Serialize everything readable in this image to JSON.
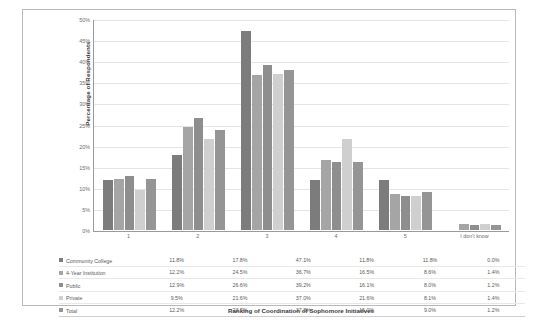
{
  "chart_data": {
    "type": "bar",
    "title": "",
    "xlabel": "Ranking of Coordination of Sophomore Initiatives",
    "ylabel": "Percentage of Respondents",
    "categories": [
      "1",
      "2",
      "3",
      "4",
      "5",
      "I don't know"
    ],
    "ylim": [
      0,
      50
    ],
    "ytick_labels": [
      "50%",
      "45%",
      "40%",
      "35%",
      "30%",
      "25%",
      "20%",
      "15%",
      "10%",
      "5%",
      "0%"
    ],
    "ytick_values": [
      50,
      45,
      40,
      35,
      30,
      25,
      20,
      15,
      10,
      5,
      0
    ],
    "grid": true,
    "legend_position": "table-below",
    "series": [
      {
        "name": "Community College",
        "color": "#7c7c7c",
        "values": [
          11.8,
          17.8,
          47.1,
          11.8,
          11.8,
          0.0
        ],
        "labels": [
          "11.8%",
          "17.8%",
          "47.1%",
          "11.8%",
          "11.8%",
          "0.0%"
        ]
      },
      {
        "name": "4-Year Institution",
        "color": "#a5a5a5",
        "values": [
          12.2,
          24.5,
          36.7,
          16.5,
          8.6,
          1.4
        ],
        "labels": [
          "12.2%",
          "24.5%",
          "36.7%",
          "16.5%",
          "8.6%",
          "1.4%"
        ]
      },
      {
        "name": "Public",
        "color": "#8e8e8e",
        "values": [
          12.9,
          26.6,
          39.2,
          16.1,
          8.0,
          1.2
        ],
        "labels": [
          "12.9%",
          "26.6%",
          "39.2%",
          "16.1%",
          "8.0%",
          "1.2%"
        ]
      },
      {
        "name": "Private",
        "color": "#cfcfcf",
        "values": [
          9.5,
          21.6,
          37.0,
          21.6,
          8.1,
          1.4
        ],
        "labels": [
          "9.5%",
          "21.6%",
          "37.0%",
          "21.6%",
          "8.1%",
          "1.4%"
        ]
      },
      {
        "name": "Total",
        "color": "#959595",
        "values": [
          12.2,
          23.7,
          37.8,
          16.0,
          9.0,
          1.2
        ],
        "labels": [
          "12.2%",
          "23.7%",
          "37.8%",
          "16.0%",
          "9.0%",
          "1.2%"
        ]
      }
    ]
  }
}
